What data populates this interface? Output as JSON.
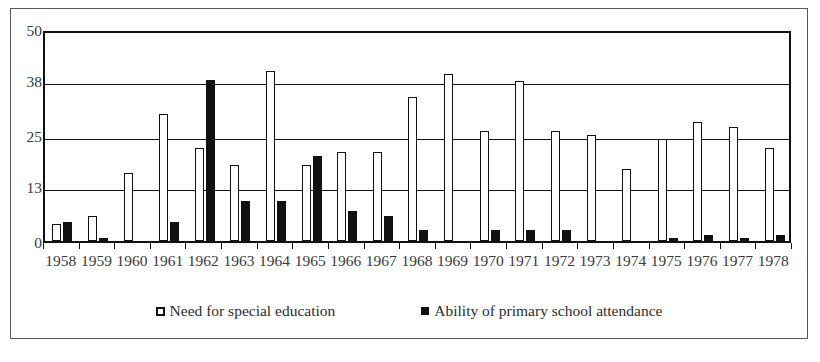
{
  "chart_data": {
    "type": "bar",
    "title": "",
    "subtitle": "",
    "xlabel": "",
    "ylabel": "",
    "ylim": [
      0,
      50
    ],
    "yticks": [
      0,
      13,
      25,
      38,
      50
    ],
    "grid": true,
    "legend_position": "bottom",
    "categories": [
      "1958",
      "1959",
      "1960",
      "1961",
      "1962",
      "1963",
      "1964",
      "1965",
      "1966",
      "1967",
      "1968",
      "1969",
      "1970",
      "1971",
      "1972",
      "1973",
      "1974",
      "1975",
      "1976",
      "1977",
      "1978"
    ],
    "series": [
      {
        "name": "Need for special education",
        "color": "#ffffff",
        "edge_color": "#111111",
        "values": [
          4,
          6,
          16,
          30,
          22,
          18,
          40,
          18,
          21,
          21,
          34,
          39.5,
          26,
          37.8,
          26,
          25,
          17,
          24,
          28,
          27,
          22
        ]
      },
      {
        "name": "Ability of primary school attendance",
        "color": "#111111",
        "edge_color": "#111111",
        "values": [
          4.5,
          0.7,
          0,
          4.5,
          38,
          9.5,
          9.5,
          20,
          7,
          6,
          2.5,
          0,
          2.5,
          2.5,
          2.5,
          0,
          0,
          0.7,
          1.5,
          0.7,
          1.5
        ]
      }
    ]
  },
  "axes": {
    "y_tick_labels": [
      "0",
      "13",
      "25",
      "38",
      "50"
    ]
  },
  "legend": {
    "items": [
      {
        "label": "Need for special education",
        "swatch": "hollow-square-marker"
      },
      {
        "label": "Ability of primary school attendance",
        "swatch": "filled-square-marker"
      }
    ]
  },
  "colors": {
    "need_fill": "#ffffff",
    "ability_fill": "#111111",
    "axis": "#111111",
    "frame": "#55585c",
    "text": "#3a3a3a"
  }
}
